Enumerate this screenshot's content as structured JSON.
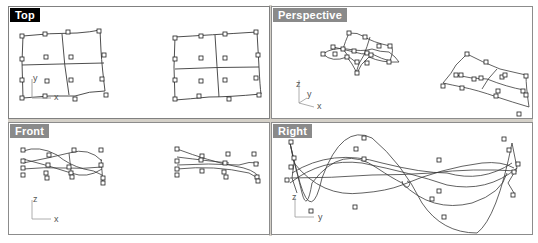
{
  "viewports": [
    {
      "id": "top",
      "label": "Top",
      "active": true,
      "axes": {
        "h": "x",
        "v": "y"
      }
    },
    {
      "id": "perspective",
      "label": "Perspective",
      "active": false,
      "axes": {
        "a": "x",
        "b": "y",
        "c": "z"
      }
    },
    {
      "id": "front",
      "label": "Front",
      "active": false,
      "axes": {
        "h": "x",
        "v": "z"
      }
    },
    {
      "id": "right",
      "label": "Right",
      "active": false,
      "axes": {
        "h": "y",
        "v": "z"
      }
    }
  ],
  "colors": {
    "active_label_bg": "#000000",
    "inactive_label_bg": "#8a8a8a",
    "label_text": "#ffffff",
    "curve": "#3a3a3a",
    "border": "#8c8c8c",
    "splitter": "#d4d0c8"
  },
  "status_text": ""
}
